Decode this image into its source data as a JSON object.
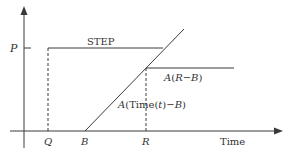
{
  "diagram": {
    "type": "line-plot-schematic",
    "colors": {
      "line": "#3a3a3a",
      "text": "#333333",
      "background": "#ffffff"
    },
    "axes": {
      "y_label": "P",
      "x_label": "Time"
    },
    "x_ticks": {
      "Q": "Q",
      "B": "B",
      "R": "R"
    },
    "annotations": {
      "step": "STEP",
      "plateau": "A(R−B)",
      "ramp_prefix": "A(Time(",
      "ramp_var": "t",
      "ramp_suffix": ")−B)"
    },
    "plateau_label": {
      "prefix": "A(",
      "var1": "R",
      "minus": "−",
      "var2": "B",
      "suffix": ")"
    },
    "ramp_label": {
      "prefix": "A(Time(",
      "var": "t",
      "mid": ")−",
      "var2": "B",
      "suffix": ")"
    }
  }
}
